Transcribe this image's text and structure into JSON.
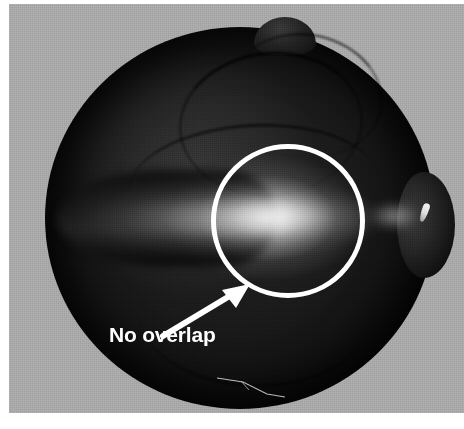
{
  "figure": {
    "domain": "natural-image",
    "medium": "grayscale photograph",
    "alt": "Grayscale photograph of a dark spherical specimen with a white circle annotation, a white arrow, and the caption 'No overlap'",
    "canvas": {
      "width": 464,
      "height": 429
    }
  },
  "colors": {
    "page_background": "#ffffff",
    "plate_background": "#a9a9a9",
    "specimen_dark": "#121212",
    "specimen_mid": "#2b2b2b",
    "annotation_white": "#ffffff",
    "highlight_band": "#f5f5f5"
  },
  "plate": {
    "name": "photo-plate",
    "left": 9,
    "top": 4,
    "width": 455,
    "height": 409
  },
  "specimen": {
    "name": "dark-sphere",
    "left": 36,
    "top": 23,
    "width": 390,
    "height": 382,
    "features": {
      "top_nodule": "top-nodule",
      "right_lobe": "right-lobe",
      "specular_fleck": "specular-fleck",
      "light_band": "light-band",
      "left_limb": "left-limb",
      "seams": [
        "seam-upper",
        "seam-crest",
        "seam-mid",
        "seam-lower"
      ],
      "bottom_streak": "bottom-streak"
    }
  },
  "annotations": {
    "circle": {
      "name": "highlight-circle",
      "shape": "circle",
      "stroke": "#ffffff",
      "stroke_width": 5,
      "center_x": 288,
      "center_y": 221,
      "radius": 77
    },
    "arrow": {
      "name": "pointer-arrow",
      "color": "#ffffff",
      "from_x": 163,
      "from_y": 336,
      "to_x": 250,
      "to_y": 284,
      "direction": "up-right",
      "points_at": "highlight-circle"
    },
    "label": {
      "name": "annotation-label",
      "text": "No overlap",
      "color": "#ffffff",
      "font_size_px": 21,
      "font_weight": "bold",
      "left": 109,
      "top": 323
    }
  }
}
